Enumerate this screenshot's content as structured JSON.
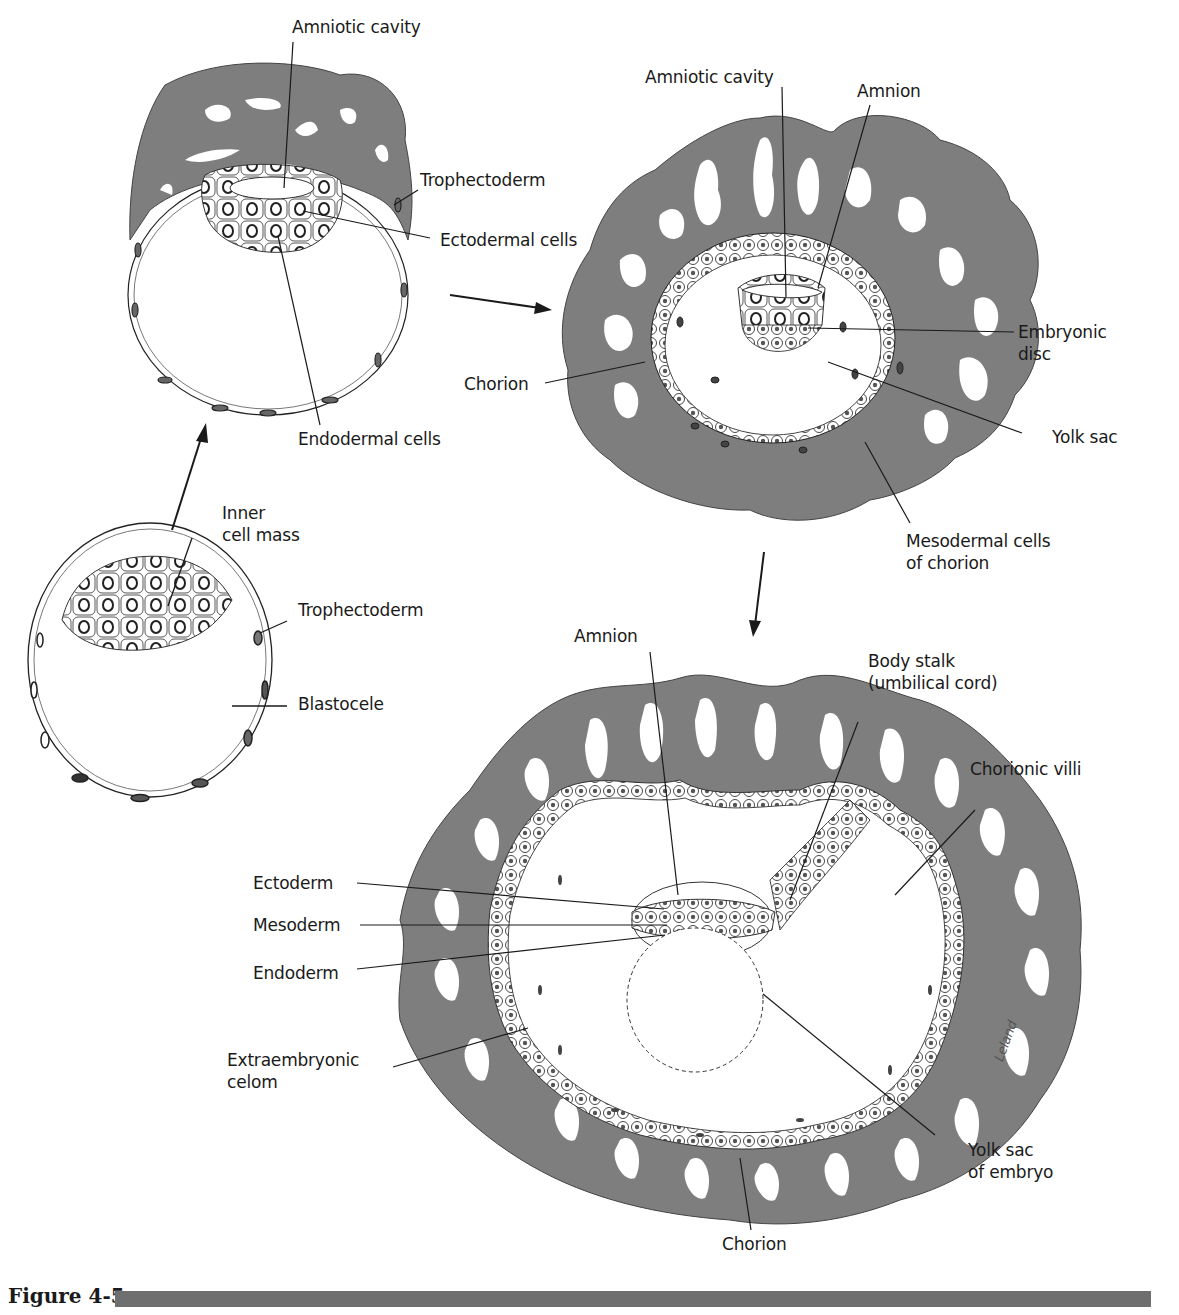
{
  "figure": {
    "caption": "Figure 4-5",
    "tissue_color": "#7e7e7e",
    "line_color": "#1a1a1a"
  },
  "stages": [
    {
      "name": "blastocyst",
      "labels": {
        "inner_cell_mass": "Inner\ncell mass",
        "trophectoderm": "Trophectoderm",
        "blastocele": "Blastocele"
      }
    },
    {
      "name": "early-implantation",
      "labels": {
        "amniotic_cavity": "Amniotic cavity",
        "trophectoderm": "Trophectoderm",
        "ectodermal_cells": "Ectodermal cells",
        "endodermal_cells": "Endodermal cells"
      }
    },
    {
      "name": "bilaminar-disc",
      "labels": {
        "amniotic_cavity": "Amniotic cavity",
        "amnion": "Amnion",
        "embryonic_disc": "Embryonic\ndisc",
        "chorion": "Chorion",
        "yolk_sac": "Yolk sac",
        "mesodermal_cells": "Mesodermal cells\nof chorion"
      }
    },
    {
      "name": "trilaminar-embryo",
      "labels": {
        "amnion": "Amnion",
        "body_stalk": "Body stalk\n(umbilical cord)",
        "chorionic_villi": "Chorionic villi",
        "ectoderm": "Ectoderm",
        "mesoderm": "Mesoderm",
        "endoderm": "Endoderm",
        "extraembryonic_celom": "Extraembryonic\ncelom",
        "yolk_sac_embryo": "Yolk sac\nof embryo",
        "chorion": "Chorion",
        "signature": "Leland"
      }
    }
  ]
}
